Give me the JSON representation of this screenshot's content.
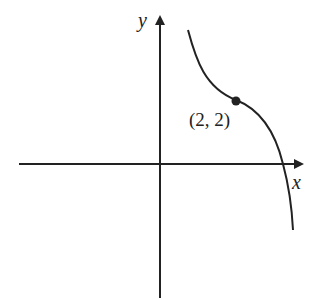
{
  "diagram": {
    "type": "function-graph",
    "axes": {
      "x_label": "x",
      "y_label": "y"
    },
    "point": {
      "label": "(2, 2)",
      "x": 2,
      "y": 2
    },
    "curve_description": "Decreasing curve with inflection point at (2, 2), crossing positive x-axis",
    "colors": {
      "stroke": "#222222",
      "background": "#ffffff"
    }
  }
}
